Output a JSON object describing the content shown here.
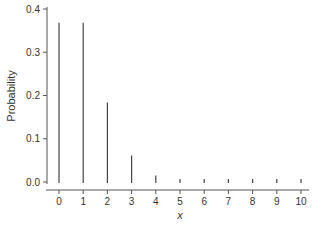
{
  "chart_data": {
    "type": "bar",
    "subtype": "stem",
    "title": "",
    "xlabel": "x",
    "ylabel": "Probability",
    "categories": [
      "0",
      "1",
      "2",
      "3",
      "4",
      "5",
      "6",
      "7",
      "8",
      "9",
      "10"
    ],
    "x": [
      0,
      1,
      2,
      3,
      4,
      5,
      6,
      7,
      8,
      9,
      10
    ],
    "values": [
      0.368,
      0.368,
      0.184,
      0.061,
      0.015,
      0.003,
      0.0005,
      0.0001,
      0.0,
      0.0,
      0.0
    ],
    "ylim": [
      0,
      0.4
    ],
    "yticks": [
      0.0,
      0.1,
      0.2,
      0.3,
      0.4
    ],
    "ytick_labels": [
      "0.0",
      "0.1",
      "0.2",
      "0.3",
      "0.4"
    ],
    "xticks": [
      0,
      1,
      2,
      3,
      4,
      5,
      6,
      7,
      8,
      9,
      10
    ],
    "grid": false,
    "legend": null,
    "colors": {
      "bar": "#444444",
      "axis": "#555555",
      "text": "#333333"
    }
  }
}
